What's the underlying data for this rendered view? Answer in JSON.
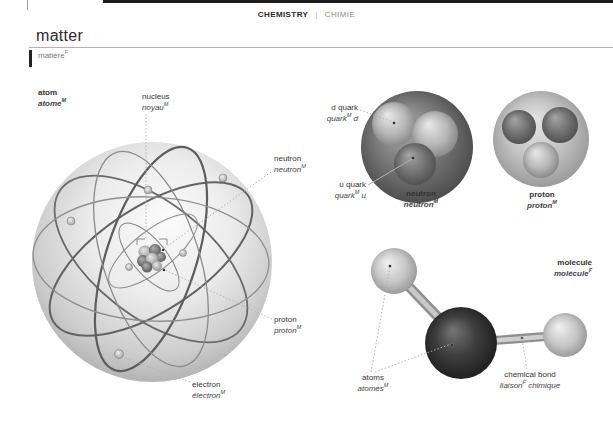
{
  "header": {
    "category_en": "CHEMISTRY",
    "separator": "|",
    "category_fr": "CHIMIE"
  },
  "title": {
    "en": "matter",
    "fr": "matière",
    "fr_sup": "F"
  },
  "labels": {
    "atom": {
      "en": "atom",
      "fr": "atome",
      "sup": "M"
    },
    "nucleus": {
      "en": "nucleus",
      "fr": "noyau",
      "sup": "M"
    },
    "neutron_pointer": {
      "en": "neutron",
      "fr": "neutron",
      "sup": "M"
    },
    "d_quark": {
      "en": "d quark",
      "fr": "quark",
      "sup": "M",
      "fr2": " d"
    },
    "u_quark": {
      "en": "u quark",
      "fr": "quark",
      "sup": "M",
      "fr2": " u"
    },
    "neutron": {
      "en": "neutron",
      "fr": "neutron",
      "sup": "M"
    },
    "proton": {
      "en": "proton",
      "fr": "proton",
      "sup": "M"
    },
    "proton_pointer": {
      "en": "proton",
      "fr": "proton",
      "sup": "M"
    },
    "electron": {
      "en": "electron",
      "fr": "électron",
      "sup": "M"
    },
    "molecule": {
      "en": "molecule",
      "fr": "molécule",
      "sup": "F"
    },
    "atoms": {
      "en": "atoms",
      "fr": "atomes",
      "sup": "M"
    },
    "chemical_bond": {
      "en": "chemical bond",
      "fr": "liaison",
      "sup": "F",
      "fr2": " chimique"
    }
  },
  "colors": {
    "page_bg": "#ffffff",
    "top_bar": "#1c1c1c",
    "heading_text": "#2b2b2b",
    "label_text": "#333333",
    "french_label_text": "#3f3f3f",
    "muted_text": "#8a8a8a",
    "rule": "#b3b3b3",
    "leader_line": "#b3b3b3",
    "orbit_stroke": "#666666"
  }
}
